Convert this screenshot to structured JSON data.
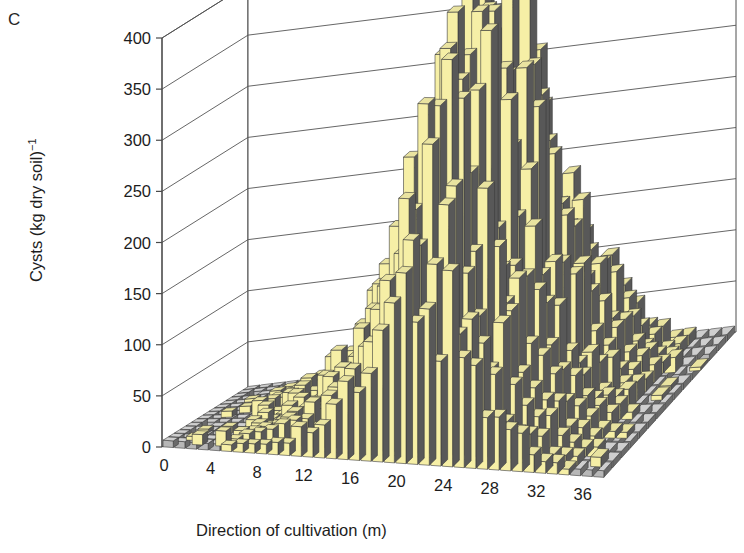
{
  "panel": {
    "label": "C"
  },
  "axes": {
    "y": {
      "title_main": "Cysts (kg dry soil)",
      "title_exp": "−1",
      "ticks": [
        0,
        50,
        100,
        150,
        200,
        250,
        300,
        350,
        400
      ],
      "min": 0,
      "max": 400
    },
    "x": {
      "title": "Direction of cultivation (m)",
      "ticks": [
        0,
        4,
        8,
        12,
        16,
        20,
        24,
        28,
        32,
        36
      ],
      "min": 0,
      "max": 38
    }
  },
  "colors": {
    "bar_face": "#F6EFA6",
    "bar_top": "#E9E3A0",
    "bar_side": "#585858",
    "floor_gray": "#B7B7B7",
    "floor_gray_top": "#CFCFCF",
    "floor_side": "#6A6A6A",
    "outline": "#3B3B3B",
    "axis": "#4A4A4A",
    "grid": "#555555",
    "text": "#1D1D1D",
    "background": "#FFFFFF"
  },
  "chart_data": {
    "type": "bar",
    "subtype": "3d-surface-bars",
    "title": "",
    "panel_label": "C",
    "xlabel": "Direction of cultivation (m)",
    "ylabel": "Cysts (kg dry soil)−1",
    "zlabel": "",
    "ylim": [
      0,
      400
    ],
    "xlim": [
      0,
      38
    ],
    "grid": true,
    "legend": null,
    "x_tick_labels": [
      "0",
      "4",
      "8",
      "12",
      "16",
      "20",
      "24",
      "28",
      "32",
      "36"
    ],
    "y_tick_labels": [
      "0",
      "50",
      "100",
      "150",
      "200",
      "250",
      "300",
      "350",
      "400"
    ],
    "n_cols": 38,
    "n_rows": 15,
    "peak_value": 390,
    "peak_x": 22,
    "values": [
      [
        0,
        0,
        0,
        0,
        0,
        0,
        0,
        0,
        0,
        0,
        0,
        0,
        0,
        0,
        0
      ],
      [
        0,
        0,
        0,
        0,
        0,
        0,
        8,
        0,
        0,
        0,
        0,
        0,
        0,
        0,
        0
      ],
      [
        0,
        0,
        0,
        0,
        10,
        0,
        0,
        0,
        6,
        0,
        0,
        0,
        0,
        0,
        0
      ],
      [
        0,
        0,
        0,
        0,
        0,
        0,
        0,
        0,
        0,
        0,
        12,
        0,
        0,
        0,
        0
      ],
      [
        0,
        0,
        0,
        9,
        0,
        0,
        0,
        0,
        0,
        0,
        0,
        0,
        0,
        8,
        0
      ],
      [
        0,
        0,
        0,
        0,
        0,
        0,
        14,
        0,
        0,
        0,
        0,
        0,
        0,
        0,
        0
      ],
      [
        0,
        0,
        0,
        0,
        0,
        0,
        0,
        0,
        0,
        18,
        0,
        0,
        0,
        0,
        0
      ],
      [
        0,
        0,
        0,
        12,
        0,
        0,
        0,
        0,
        22,
        0,
        0,
        0,
        0,
        0,
        0
      ],
      [
        0,
        0,
        0,
        0,
        0,
        26,
        0,
        0,
        0,
        0,
        0,
        0,
        30,
        0,
        0
      ],
      [
        0,
        0,
        0,
        0,
        0,
        0,
        0,
        0,
        0,
        0,
        0,
        0,
        0,
        0,
        0
      ],
      [
        0,
        0,
        0,
        0,
        0,
        36,
        0,
        0,
        0,
        42,
        0,
        0,
        0,
        0,
        0
      ],
      [
        0,
        0,
        0,
        0,
        0,
        0,
        28,
        0,
        0,
        0,
        0,
        0,
        0,
        0,
        0
      ],
      [
        0,
        0,
        22,
        0,
        0,
        0,
        0,
        0,
        0,
        0,
        0,
        0,
        0,
        0,
        0
      ],
      [
        0,
        0,
        0,
        0,
        0,
        0,
        0,
        0,
        0,
        0,
        0,
        0,
        0,
        0,
        0
      ],
      [
        0,
        0,
        0,
        0,
        0,
        0,
        0,
        0,
        0,
        0,
        0,
        0,
        0,
        0,
        0
      ],
      [
        0,
        0,
        0,
        0,
        0,
        55,
        0,
        0,
        0,
        0,
        0,
        0,
        0,
        0,
        0
      ],
      [
        0,
        0,
        0,
        0,
        0,
        0,
        0,
        0,
        0,
        0,
        0,
        0,
        0,
        0,
        0
      ],
      [
        0,
        0,
        0,
        0,
        0,
        0,
        0,
        0,
        0,
        0,
        0,
        0,
        0,
        0,
        0
      ],
      [
        0,
        0,
        0,
        0,
        0,
        0,
        0,
        0,
        0,
        0,
        0,
        0,
        0,
        0,
        0
      ],
      [
        0,
        0,
        0,
        0,
        0,
        0,
        0,
        0,
        0,
        0,
        0,
        0,
        0,
        0,
        0
      ],
      [
        0,
        0,
        0,
        0,
        0,
        0,
        0,
        0,
        0,
        0,
        0,
        0,
        0,
        0,
        0
      ],
      [
        0,
        0,
        0,
        0,
        0,
        0,
        0,
        0,
        0,
        0,
        0,
        0,
        0,
        0,
        0
      ],
      [
        0,
        0,
        0,
        0,
        0,
        0,
        0,
        0,
        0,
        0,
        0,
        0,
        0,
        0,
        0
      ],
      [
        0,
        0,
        0,
        0,
        0,
        0,
        0,
        0,
        0,
        0,
        0,
        0,
        0,
        0,
        0
      ],
      [
        0,
        0,
        0,
        0,
        0,
        0,
        0,
        0,
        0,
        0,
        0,
        0,
        0,
        0,
        0
      ],
      [
        0,
        0,
        0,
        0,
        0,
        0,
        0,
        0,
        0,
        0,
        0,
        0,
        0,
        0,
        0
      ],
      [
        0,
        0,
        0,
        0,
        0,
        0,
        0,
        0,
        0,
        0,
        0,
        0,
        0,
        0,
        0
      ],
      [
        0,
        0,
        0,
        0,
        0,
        0,
        0,
        0,
        0,
        0,
        0,
        0,
        0,
        0,
        0
      ],
      [
        0,
        0,
        0,
        0,
        0,
        0,
        0,
        0,
        0,
        0,
        0,
        0,
        0,
        0,
        0
      ],
      [
        0,
        0,
        0,
        0,
        0,
        0,
        0,
        0,
        0,
        0,
        0,
        0,
        0,
        0,
        0
      ],
      [
        0,
        0,
        0,
        0,
        0,
        0,
        0,
        0,
        0,
        0,
        0,
        0,
        0,
        0,
        0
      ],
      [
        0,
        0,
        0,
        0,
        0,
        0,
        0,
        0,
        0,
        0,
        0,
        0,
        0,
        0,
        0
      ],
      [
        0,
        0,
        0,
        0,
        0,
        0,
        0,
        0,
        0,
        0,
        0,
        0,
        0,
        0,
        0
      ],
      [
        0,
        0,
        0,
        0,
        0,
        0,
        0,
        0,
        0,
        0,
        0,
        0,
        0,
        0,
        0
      ],
      [
        0,
        0,
        0,
        0,
        0,
        0,
        0,
        0,
        0,
        0,
        0,
        0,
        0,
        0,
        0
      ],
      [
        0,
        0,
        0,
        0,
        0,
        0,
        0,
        0,
        0,
        0,
        0,
        0,
        0,
        0,
        0
      ],
      [
        0,
        0,
        0,
        0,
        0,
        0,
        0,
        0,
        0,
        0,
        0,
        0,
        0,
        0,
        0
      ],
      [
        0,
        0,
        0,
        0,
        0,
        0,
        0,
        0,
        0,
        0,
        0,
        0,
        0,
        0,
        0
      ]
    ],
    "column_profile_peak": [
      0,
      5,
      8,
      10,
      12,
      14,
      18,
      22,
      28,
      34,
      45,
      52,
      60,
      75,
      95,
      120,
      150,
      185,
      230,
      280,
      330,
      370,
      390,
      355,
      300,
      250,
      200,
      160,
      120,
      90,
      65,
      45,
      30,
      20,
      14,
      10,
      6,
      3
    ]
  }
}
